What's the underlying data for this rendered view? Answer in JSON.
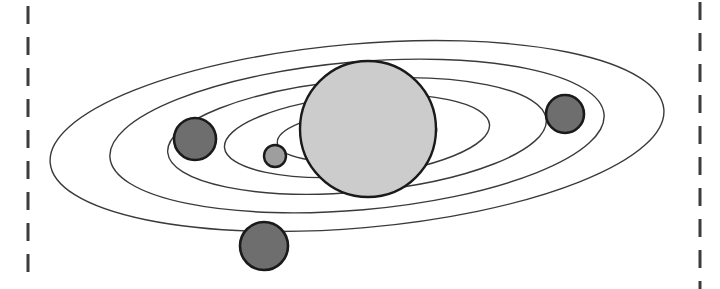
{
  "canvas": {
    "width": 720,
    "height": 289,
    "background": "#ffffff",
    "title": "Solar System Orbit Diagram"
  },
  "palette": {
    "stroke_dark": "#1a1a1a",
    "orbit_stroke": "#3a3a3a",
    "sun_fill": "#cccccc",
    "planet_dark_fill": "#6e6e6e",
    "planet_light_fill": "#9e9e9e",
    "dashed_line_color": "#3c3c3c"
  },
  "crop_markers": {
    "label": "crop boundary markers",
    "left": {
      "name": "left-crop-dashed-line",
      "x": 28,
      "y1": 6,
      "y2": 285,
      "width": 3,
      "dash": 18,
      "gap": 13,
      "color": "#3c3c3c"
    },
    "right": {
      "name": "right-crop-dashed-line",
      "x": 700,
      "y1": 2,
      "y2": 289,
      "width": 3,
      "dash": 18,
      "gap": 13,
      "color": "#3c3c3c"
    }
  },
  "system": {
    "center_x": 357,
    "center_y": 136,
    "tilt_degrees": -5,
    "orbit_count": 5,
    "body_count": 5
  },
  "orbits": [
    {
      "name": "orbit-1-outermost",
      "rx": 308,
      "ry": 92,
      "stroke_width": 1.4
    },
    {
      "name": "orbit-2",
      "rx": 248,
      "ry": 74,
      "stroke_width": 1.4
    },
    {
      "name": "orbit-3",
      "rx": 190,
      "ry": 56,
      "stroke_width": 1.4
    },
    {
      "name": "orbit-4",
      "rx": 133,
      "ry": 40,
      "stroke_width": 1.4
    },
    {
      "name": "orbit-5-innermost",
      "rx": 80,
      "ry": 25,
      "stroke_width": 1.4
    }
  ],
  "bodies": [
    {
      "name": "sun",
      "role": "star",
      "cx": 368,
      "cy": 129,
      "r": 68,
      "fill": "#cccccc",
      "stroke": "#1a1a1a",
      "stroke_width": 2.4
    },
    {
      "name": "planet-left",
      "role": "planet",
      "cx": 195,
      "cy": 139,
      "r": 21,
      "fill": "#6e6e6e",
      "stroke": "#1a1a1a",
      "stroke_width": 2.6
    },
    {
      "name": "planet-bottom",
      "role": "planet",
      "cx": 264,
      "cy": 246,
      "r": 24,
      "fill": "#6e6e6e",
      "stroke": "#1a1a1a",
      "stroke_width": 2.6
    },
    {
      "name": "planet-right",
      "role": "planet",
      "cx": 565,
      "cy": 114,
      "r": 19,
      "fill": "#6e6e6e",
      "stroke": "#1a1a1a",
      "stroke_width": 2.6
    },
    {
      "name": "planet-inner-small",
      "role": "planet",
      "cx": 275,
      "cy": 156,
      "r": 11,
      "fill": "#9e9e9e",
      "stroke": "#1a1a1a",
      "stroke_width": 2.4
    }
  ]
}
